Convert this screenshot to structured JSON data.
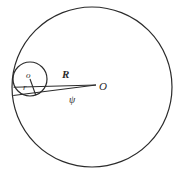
{
  "figure": {
    "canvas": {
      "width": 183,
      "height": 177,
      "background": "#ffffff"
    },
    "stroke": {
      "color": "#2b2b2b",
      "width": 1.1
    },
    "shapes": {
      "large_circle": {
        "name": "large-circle",
        "cx": 92,
        "cy": 87,
        "r": 80
      },
      "small_circle": {
        "name": "small-circle",
        "cx": 30,
        "cy": 79,
        "r": 17
      },
      "upper_tangent": {
        "name": "upper-tangent-line",
        "x1": 14,
        "y1": 87,
        "x2": 96,
        "y2": 85
      },
      "lower_tangent": {
        "name": "lower-tangent-line",
        "x1": 13,
        "y1": 95,
        "x2": 96,
        "y2": 85
      },
      "radius_segment": {
        "name": "small-radius-segment",
        "x1": 30,
        "y1": 79,
        "x2": 36,
        "y2": 95
      }
    },
    "labels": {
      "small_center": "o",
      "small_radius": "r",
      "large_radius": "R",
      "large_center": "O",
      "angle": "ψ"
    }
  }
}
